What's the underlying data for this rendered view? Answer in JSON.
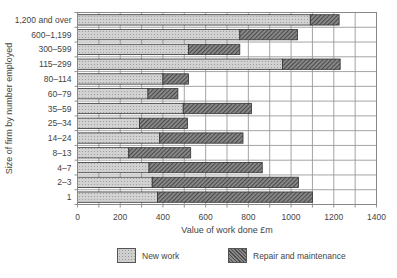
{
  "chart_data": {
    "type": "bar",
    "orientation": "horizontal",
    "stacked": true,
    "title": "",
    "xlabel": "Value of work done £m",
    "ylabel": "Size of firm by number employed",
    "xlim": [
      0,
      1400
    ],
    "xticks": [
      0,
      200,
      400,
      600,
      800,
      1000,
      1200,
      1400
    ],
    "grid": true,
    "legend_position": "bottom",
    "categories": [
      "1,200 and over",
      "600–1,199",
      "300–599",
      "115–299",
      "80–114",
      "60–79",
      "35–59",
      "25–34",
      "14–24",
      "8–13",
      "4–7",
      "2–3",
      "1"
    ],
    "series": [
      {
        "name": "New work",
        "pattern": "dotted-light",
        "color": "#cfcfcf",
        "values": [
          1090,
          760,
          520,
          960,
          400,
          330,
          495,
          290,
          385,
          240,
          335,
          350,
          375
        ]
      },
      {
        "name": "Repair and maintenance",
        "pattern": "hatched-dark",
        "color": "#6e6e6e",
        "values": [
          135,
          270,
          240,
          270,
          120,
          140,
          320,
          225,
          390,
          290,
          530,
          685,
          725
        ]
      }
    ]
  },
  "legend": {
    "items": [
      {
        "label": "New work"
      },
      {
        "label": "Repair and maintenance"
      }
    ]
  }
}
